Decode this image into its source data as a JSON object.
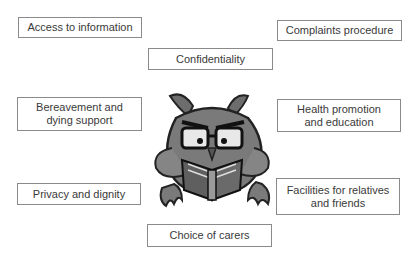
{
  "diagram": {
    "type": "mind-map",
    "center_image": "owl-reading-book",
    "items": [
      {
        "id": "access",
        "label": "Access to information"
      },
      {
        "id": "confidentiality",
        "label": "Confidentiality"
      },
      {
        "id": "complaints",
        "label": "Complaints procedure"
      },
      {
        "id": "bereavement",
        "label": "Bereavement and\ndying support"
      },
      {
        "id": "health",
        "label": "Health promotion\nand education"
      },
      {
        "id": "privacy",
        "label": "Privacy and dignity"
      },
      {
        "id": "facilities",
        "label": "Facilities for relatives\nand friends"
      },
      {
        "id": "choice",
        "label": "Choice of carers"
      }
    ]
  },
  "colors": {
    "border": "#8a8a8a",
    "text": "#3a3a3a",
    "owl_body": "#7a7a7a",
    "owl_dark": "#2a2a2a"
  }
}
